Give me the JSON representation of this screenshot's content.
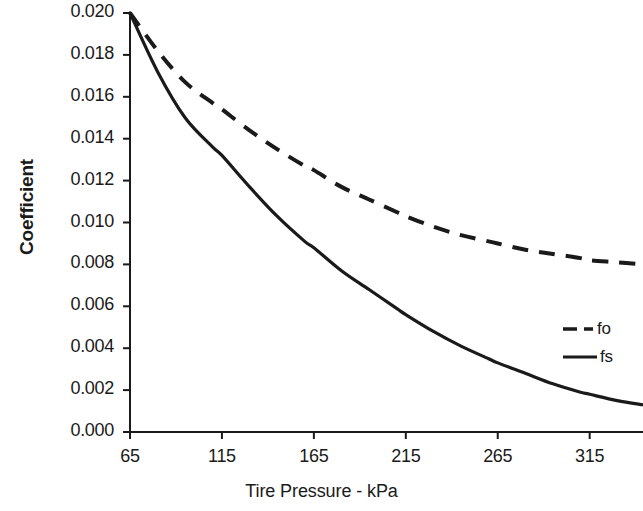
{
  "chart_data": {
    "type": "line",
    "title": "",
    "xlabel": "Tire Pressure - kPa",
    "ylabel": "Coefficient",
    "xlim": [
      65,
      344
    ],
    "ylim": [
      0.0,
      0.02
    ],
    "grid": false,
    "legend_position": "center-right",
    "xticks": [
      65,
      115,
      165,
      215,
      265,
      315
    ],
    "xtick_labels": [
      "65",
      "115",
      "165",
      "215",
      "265",
      "315"
    ],
    "yticks": [
      0.0,
      0.002,
      0.004,
      0.006,
      0.008,
      0.01,
      0.012,
      0.014,
      0.016,
      0.018,
      0.02
    ],
    "ytick_labels": [
      "0.000",
      "0.002",
      "0.004",
      "0.006",
      "0.008",
      "0.010",
      "0.012",
      "0.014",
      "0.016",
      "0.018",
      "0.020"
    ],
    "x": [
      65,
      80,
      95,
      110,
      115,
      130,
      145,
      160,
      165,
      180,
      195,
      210,
      215,
      230,
      245,
      260,
      265,
      280,
      295,
      310,
      315,
      330,
      344
    ],
    "series": [
      {
        "name": "fo",
        "style": "dashed",
        "color": "#1a1a1a",
        "values": [
          0.02,
          0.0182,
          0.0167,
          0.0157,
          0.0154,
          0.0144,
          0.0135,
          0.0127,
          0.0125,
          0.0117,
          0.0111,
          0.0105,
          0.0103,
          0.0098,
          0.0094,
          0.0091,
          0.009,
          0.0087,
          0.0085,
          0.0083,
          0.0082,
          0.0081,
          0.008
        ]
      },
      {
        "name": "fs",
        "style": "solid",
        "color": "#1a1a1a",
        "values": [
          0.02,
          0.0172,
          0.015,
          0.0136,
          0.0132,
          0.0117,
          0.0103,
          0.0091,
          0.0088,
          0.0077,
          0.0068,
          0.0059,
          0.0056,
          0.0048,
          0.0041,
          0.0035,
          0.0033,
          0.0028,
          0.0023,
          0.0019,
          0.0018,
          0.0015,
          0.0013
        ]
      }
    ],
    "legend_entries": [
      {
        "label": "fo",
        "style": "dashed"
      },
      {
        "label": "fs",
        "style": "solid"
      }
    ]
  }
}
